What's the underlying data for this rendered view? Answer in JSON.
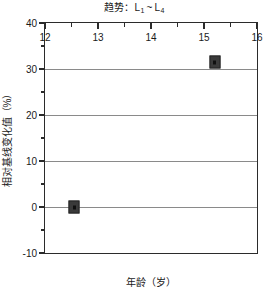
{
  "chart_data": {
    "type": "scatter",
    "title_parts": {
      "prefix": "趋势：L",
      "sub1": "1",
      "tilde": "~",
      "mid": "L",
      "sub2": "4"
    },
    "xlabel": "年龄（岁）",
    "ylabel": "相对基线变化值（%）",
    "xlim": [
      12,
      16
    ],
    "ylim": [
      -10,
      40
    ],
    "x_ticks": [
      12,
      13,
      14,
      15,
      16
    ],
    "x_tick_labels": [
      "12",
      "13",
      "14",
      "15",
      "16"
    ],
    "x_minor_step": 0.5,
    "y_ticks": [
      -10,
      0,
      10,
      20,
      30,
      40
    ],
    "y_tick_labels": [
      "-10",
      "0",
      "10",
      "20",
      "30",
      "40"
    ],
    "y_minor_step": 5,
    "grid": {
      "horizontal": true,
      "horizontal_values": [
        0,
        10,
        20,
        30
      ],
      "vertical": false,
      "color": "#8a8a8a"
    },
    "legend": null,
    "marker_color": "#3a3a3a",
    "marker_shape": "square",
    "points": [
      {
        "x": 12.55,
        "y": 0.0,
        "label": "L1"
      },
      {
        "x": 15.2,
        "y": 31.5,
        "label": "L4"
      }
    ]
  }
}
